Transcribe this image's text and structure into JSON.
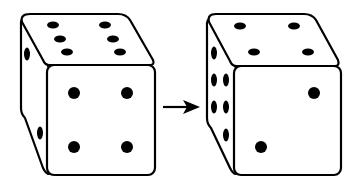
{
  "diagram": {
    "colors": {
      "outline": "#000000",
      "face": "#ffffff",
      "pip": "#000000"
    },
    "left_die": {
      "top_face": 6,
      "front_face": 4,
      "side_face": 2
    },
    "arrow": {
      "direction": "right"
    },
    "right_die": {
      "top_face": 4,
      "front_face": 2,
      "side_face": 6
    }
  }
}
